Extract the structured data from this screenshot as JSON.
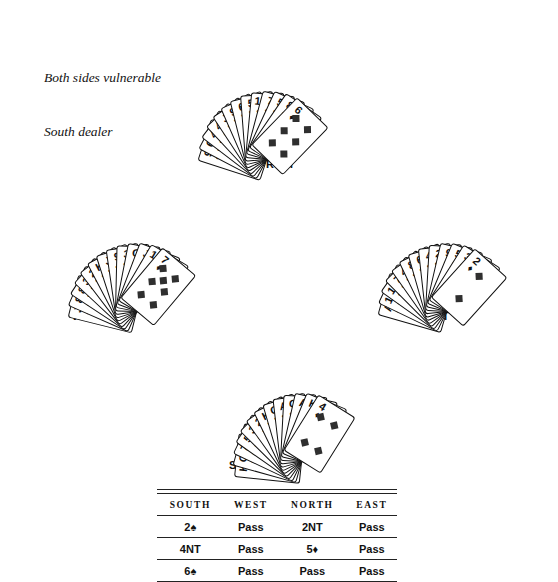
{
  "annotation": {
    "line1": "Both sides vulnerable",
    "line2": "South dealer"
  },
  "seats": {
    "north": "NORTH",
    "west": "WEST",
    "east": "EAST",
    "south": "SOUTH"
  },
  "suit_glyphs": {
    "spade": "♠",
    "heart": "♥",
    "diamond": "♦",
    "club": "♣"
  },
  "hands": {
    "north": {
      "label": "NORTH",
      "cards": [
        {
          "rank": "9",
          "suit": "club"
        },
        {
          "rank": "6",
          "suit": "club"
        },
        {
          "rank": "4",
          "suit": "club"
        },
        {
          "rank": "4",
          "suit": "spade"
        },
        {
          "rank": "J",
          "suit": "heart"
        },
        {
          "rank": "9",
          "suit": "heart"
        },
        {
          "rank": "6",
          "suit": "heart"
        },
        {
          "rank": "5",
          "suit": "heart"
        },
        {
          "rank": "10",
          "suit": "club"
        },
        {
          "rank": "7",
          "suit": "club"
        },
        {
          "rank": "5",
          "suit": "club"
        },
        {
          "rank": "8",
          "suit": "diamond"
        },
        {
          "rank": "6",
          "suit": "diamond"
        }
      ],
      "front_card": {
        "rank": "6",
        "suit": "diamond"
      }
    },
    "west": {
      "label": "WEST",
      "cards": [
        {
          "rank": "J",
          "suit": "spade"
        },
        {
          "rank": "8",
          "suit": "spade"
        },
        {
          "rank": "8",
          "suit": "heart"
        },
        {
          "rank": "3",
          "suit": "heart"
        },
        {
          "rank": "2",
          "suit": "heart"
        },
        {
          "rank": "K",
          "suit": "club"
        },
        {
          "rank": "J",
          "suit": "club"
        },
        {
          "rank": "9",
          "suit": "club"
        },
        {
          "rank": "3",
          "suit": "club"
        },
        {
          "rank": "Q",
          "suit": "diamond"
        },
        {
          "rank": "J",
          "suit": "diamond"
        },
        {
          "rank": "10",
          "suit": "diamond"
        },
        {
          "rank": "7",
          "suit": "diamond"
        }
      ],
      "front_card": {
        "rank": "7",
        "suit": "diamond"
      }
    },
    "east": {
      "label": "EAST",
      "cards": [
        {
          "rank": "A",
          "suit": "spade"
        },
        {
          "rank": "10",
          "suit": "spade"
        },
        {
          "rank": "10",
          "suit": "heart"
        },
        {
          "rank": "7",
          "suit": "heart"
        },
        {
          "rank": "4",
          "suit": "heart"
        },
        {
          "rank": "8",
          "suit": "club"
        },
        {
          "rank": "6",
          "suit": "club"
        },
        {
          "rank": "4",
          "suit": "club"
        },
        {
          "rank": "2",
          "suit": "club"
        },
        {
          "rank": "9",
          "suit": "diamond"
        },
        {
          "rank": "5",
          "suit": "diamond"
        },
        {
          "rank": "3",
          "suit": "diamond"
        },
        {
          "rank": "2",
          "suit": "diamond"
        }
      ],
      "front_card": {
        "rank": "2",
        "suit": "diamond"
      }
    },
    "south": {
      "label": "SOUTH",
      "cards": [
        {
          "rank": "K",
          "suit": "spade"
        },
        {
          "rank": "Q",
          "suit": "spade"
        },
        {
          "rank": "7",
          "suit": "spade"
        },
        {
          "rank": "5",
          "suit": "spade"
        },
        {
          "rank": "3",
          "suit": "spade"
        },
        {
          "rank": "2",
          "suit": "spade"
        },
        {
          "rank": "K",
          "suit": "heart"
        },
        {
          "rank": "Q",
          "suit": "heart"
        },
        {
          "rank": "A",
          "suit": "club"
        },
        {
          "rank": "Q",
          "suit": "club"
        },
        {
          "rank": "A",
          "suit": "diamond"
        },
        {
          "rank": "K",
          "suit": "diamond"
        },
        {
          "rank": "4",
          "suit": "diamond"
        }
      ],
      "front_card": {
        "rank": "4",
        "suit": "diamond"
      }
    }
  },
  "bidding": {
    "headers": [
      "SOUTH",
      "WEST",
      "NORTH",
      "EAST"
    ],
    "rows": [
      [
        "2♠",
        "Pass",
        "2NT",
        "Pass"
      ],
      [
        "4NT",
        "Pass",
        "5♦",
        "Pass"
      ],
      [
        "6♠",
        "Pass",
        "Pass",
        "Pass"
      ]
    ]
  }
}
